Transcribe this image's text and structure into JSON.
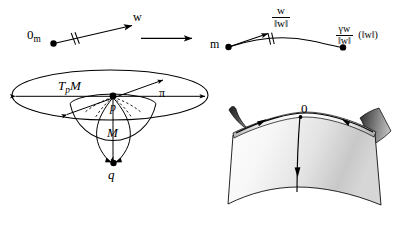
{
  "figure": {
    "background_color": "#ffffff",
    "stroke_color": "#000000",
    "panels": [
      {
        "id": "tangent-vector-panel",
        "role": "left domain panel"
      },
      {
        "id": "geodesic-panel",
        "role": "right image panel"
      },
      {
        "id": "manifold-panel",
        "role": "tangent plane and sphere"
      },
      {
        "id": "saddle-panel",
        "role": "saddle surface with geodesics"
      }
    ]
  },
  "panel_left": {
    "origin_label": "0",
    "origin_subscript": "m",
    "vector_label": "w",
    "tick_marks": 2
  },
  "transition": {
    "arrow_name": "maps-to-arrow",
    "label": ""
  },
  "panel_right": {
    "base_point_label": "m",
    "unit_vector": {
      "numerator": "w",
      "denominator": "‖w‖"
    },
    "endpoint_expression": {
      "numerator": "γw",
      "denominator": "‖w‖",
      "argument": "(‖w‖)"
    },
    "tick_marks": 2
  },
  "panel_manifold": {
    "tangent_space_label": "T",
    "tangent_space_subscript": "p",
    "tangent_space_manifold": "M",
    "projection_label": "π",
    "base_point_label": "p",
    "manifold_label": "M",
    "antipode_label": "q"
  },
  "panel_saddle": {
    "origin_label": "0"
  },
  "colors": {
    "ink": "#000000",
    "paper": "#ffffff",
    "surface_light": "#f2f2f2",
    "surface_mid": "#c9c9c9",
    "surface_dark": "#3a3a3a",
    "surface_flap": "#2b2b2b"
  }
}
